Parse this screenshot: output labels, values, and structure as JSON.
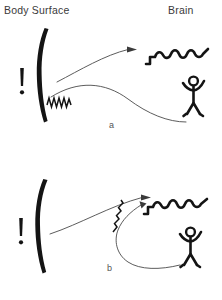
{
  "figure": {
    "title_left": "Body Surface",
    "title_right": "Brain",
    "background_color": "#ffffff",
    "ink_color": "#141414",
    "line_color": "#4a4a4a",
    "width": 222,
    "height": 300
  },
  "panels": [
    {
      "id": "a",
      "label": "a",
      "body_surface_icon": "thick-curved-line",
      "pain_marker": "!",
      "zigzag_label": "zigzag-signal",
      "zigzag_location": "body-surface",
      "brain_icon": "wavy-brain-line",
      "person_icon": "stick-figure",
      "arrows": [
        {
          "name": "surface-to-brain-arrow",
          "from": "body-surface",
          "to": "brain",
          "arrowhead": true
        },
        {
          "name": "surface-to-person-arrow",
          "from": "body-surface",
          "to": "person",
          "arrowhead": false
        }
      ]
    },
    {
      "id": "b",
      "label": "b",
      "body_surface_icon": "thick-curved-line",
      "pain_marker": "!",
      "zigzag_label": "zigzag-signal",
      "zigzag_location": "brain-loop",
      "brain_icon": "wavy-brain-line",
      "person_icon": "stick-figure",
      "arrows": [
        {
          "name": "surface-to-brain-arrow",
          "from": "body-surface",
          "to": "brain",
          "arrowhead": true
        },
        {
          "name": "person-to-brain-loop-arrow",
          "from": "person",
          "to": "brain",
          "arrowhead": true
        }
      ]
    }
  ]
}
